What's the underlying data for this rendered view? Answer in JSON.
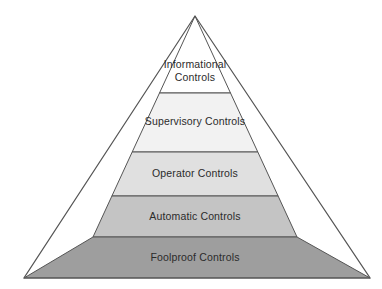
{
  "diagram": {
    "type": "pyramid",
    "title": "",
    "background_color": "#ffffff",
    "outline_color": "#555555",
    "text_color": "#2b2b2b",
    "apex": {
      "x": 195,
      "y": 16
    },
    "base": {
      "left_x": 24,
      "right_x": 370,
      "y": 278
    },
    "tiers": [
      {
        "id": "informational",
        "label": "Informational\nControls",
        "label_line_1": "Informational",
        "label_line_2": "Controls",
        "level": 1,
        "position": "top",
        "fill_color": "#ffffff",
        "top_y": 16,
        "bottom_y": 93
      },
      {
        "id": "supervisory",
        "label": "Supervisory Controls",
        "level": 2,
        "position": "upper-middle",
        "fill_color": "#f2f2f2",
        "top_y": 93,
        "bottom_y": 152
      },
      {
        "id": "operator",
        "label": "Operator Controls",
        "level": 3,
        "position": "middle",
        "fill_color": "#e0e0e0",
        "top_y": 152,
        "bottom_y": 196
      },
      {
        "id": "automatic",
        "label": "Automatic Controls",
        "level": 4,
        "position": "lower-middle",
        "fill_color": "#c4c4c4",
        "top_y": 196,
        "bottom_y": 237
      },
      {
        "id": "foolproof",
        "label": "Foolproof Controls",
        "level": 5,
        "position": "bottom",
        "fill_color": "#9e9e9e",
        "top_y": 237,
        "bottom_y": 278
      }
    ]
  }
}
